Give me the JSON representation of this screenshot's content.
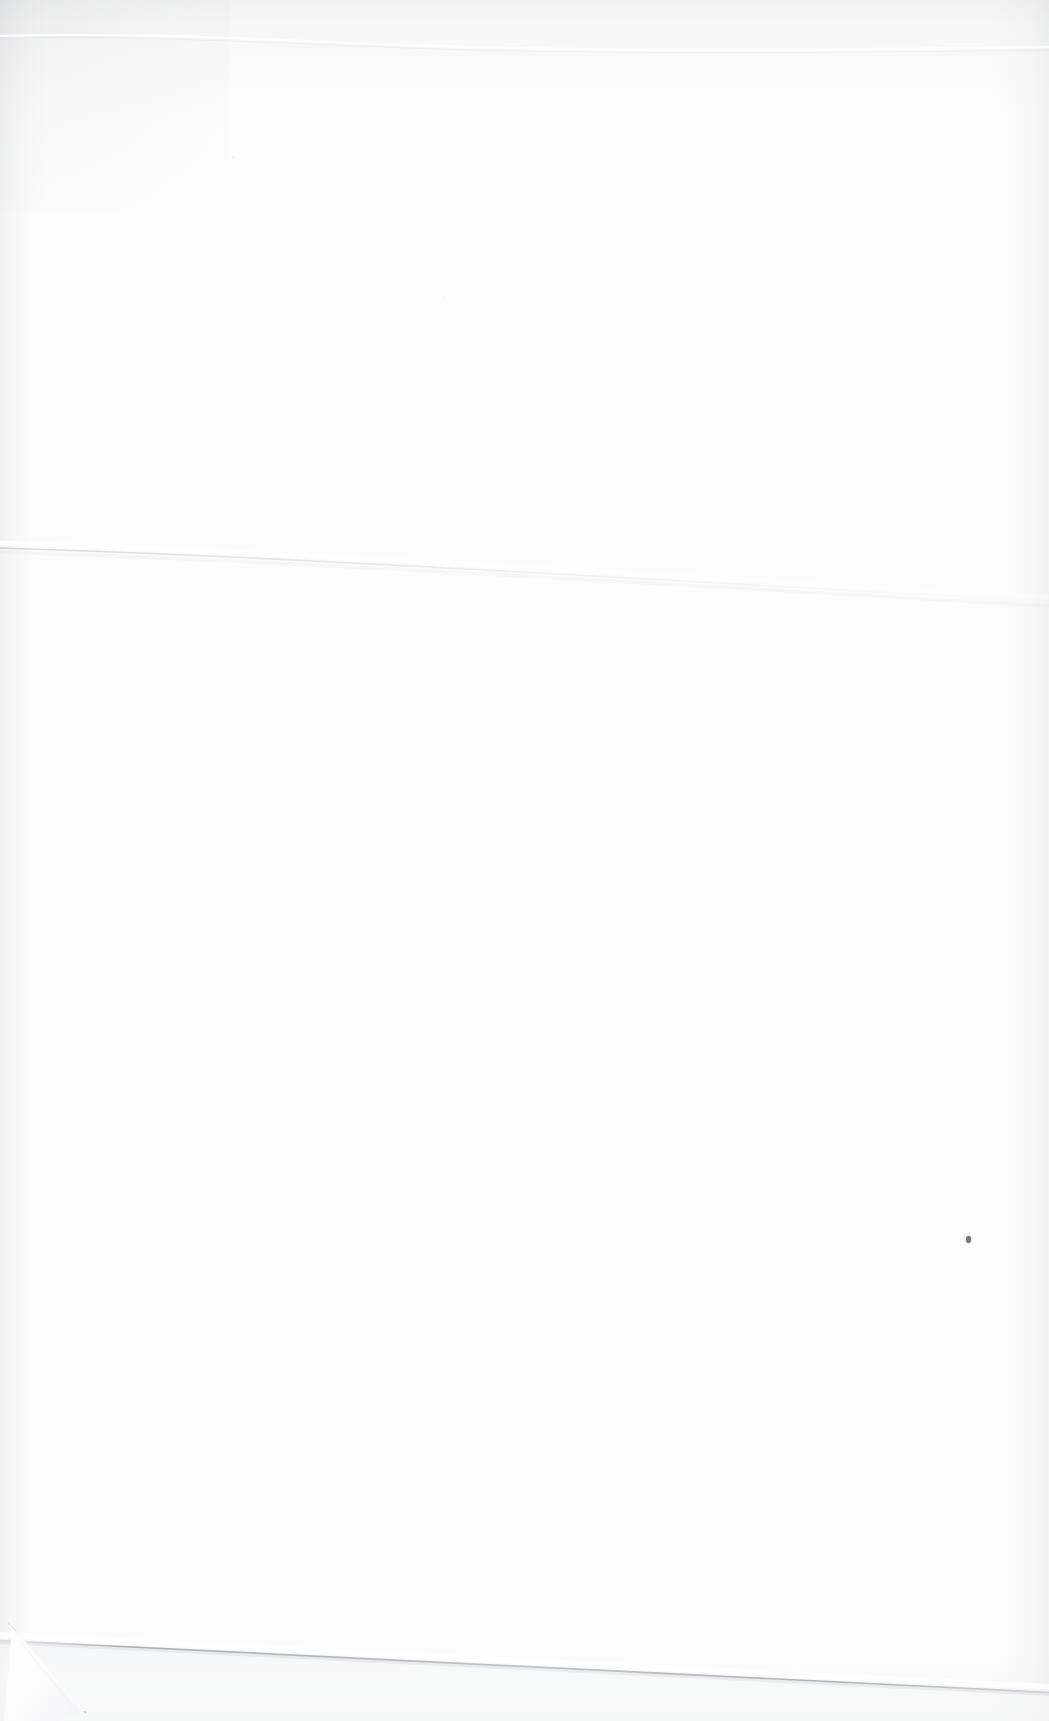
{
  "document": {
    "kind": "scanned-page",
    "content_text": "",
    "page_width": 1049,
    "page_height": 1721
  },
  "colors": {
    "paper": "#fefefe",
    "page_background": "#ffffff",
    "shadow": "#787d82",
    "crease_line": "#c9ccd1",
    "page_edge_line": "#b9bdc3",
    "ink_speck": "#5a5a5c",
    "under_sheet": "#f7f8f9"
  },
  "artifacts": {
    "crease": {
      "name": "diagonal-fold-crease",
      "start_x": 0,
      "start_y": 548,
      "end_x": 1049,
      "end_y": 602
    },
    "page_edge": {
      "name": "page-bottom-edge",
      "start_x": 0,
      "start_y": 1638,
      "end_x": 1049,
      "end_y": 1692
    },
    "dogear": {
      "name": "folded-corner-bottom-left",
      "x": 10,
      "y": 1618,
      "width": 75,
      "height": 103
    },
    "speck": {
      "name": "ink-speck",
      "x": 966,
      "y": 1236,
      "width": 5,
      "height": 7
    }
  }
}
